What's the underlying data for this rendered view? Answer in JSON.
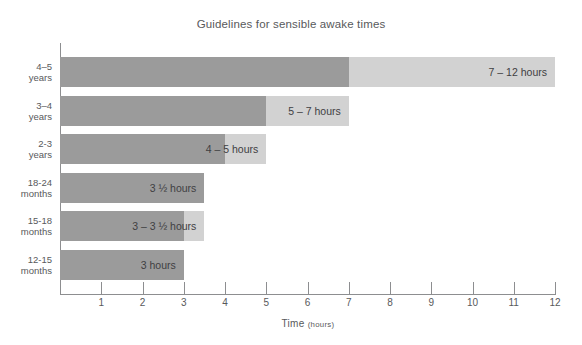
{
  "chart_data": {
    "type": "bar",
    "title": "Guidelines for sensible awake times",
    "xlabel_main": "Time",
    "xlabel_unit": "(hours)",
    "ylabel": "",
    "xlim": [
      0,
      12
    ],
    "xticks": [
      1,
      2,
      3,
      4,
      5,
      6,
      7,
      8,
      9,
      10,
      11,
      12
    ],
    "grid": false,
    "legend": "none",
    "orientation": "horizontal",
    "categories": [
      "4–5 years",
      "3–4 years",
      "2-3 years",
      "18-24 months",
      "15-18 months",
      "12-15 months"
    ],
    "category_lines": [
      {
        "line1": "4–5",
        "line2": "years"
      },
      {
        "line1": "3–4",
        "line2": "years"
      },
      {
        "line1": "2-3",
        "line2": "years"
      },
      {
        "line1": "18-24",
        "line2": "months"
      },
      {
        "line1": "15-18",
        "line2": "months"
      },
      {
        "line1": "12-15",
        "line2": "months"
      }
    ],
    "series": [
      {
        "name": "minimum awake time",
        "values": [
          7,
          5,
          4,
          3.5,
          3,
          3
        ]
      },
      {
        "name": "maximum awake time",
        "values": [
          12,
          7,
          5,
          3.5,
          3.5,
          3
        ]
      }
    ],
    "bars": [
      {
        "category": "4–5 years",
        "min": 7,
        "max": 12,
        "label": "7 – 12 hours"
      },
      {
        "category": "3–4 years",
        "min": 5,
        "max": 7,
        "label": "5 – 7 hours"
      },
      {
        "category": "2-3 years",
        "min": 4,
        "max": 5,
        "label": "4 – 5 hours"
      },
      {
        "category": "18-24 months",
        "min": 3.5,
        "max": 3.5,
        "label": "3 ½ hours"
      },
      {
        "category": "15-18 months",
        "min": 3,
        "max": 3.5,
        "label": "3 – 3 ½ hours"
      },
      {
        "category": "12-15 months",
        "min": 3,
        "max": 3,
        "label": "3 hours"
      }
    ],
    "colors": {
      "bar_dark": "#9b9b9b",
      "bar_light": "#d2d2d2",
      "axis": "#8d8e90",
      "text": "#58595b",
      "background": "#ffffff"
    }
  }
}
